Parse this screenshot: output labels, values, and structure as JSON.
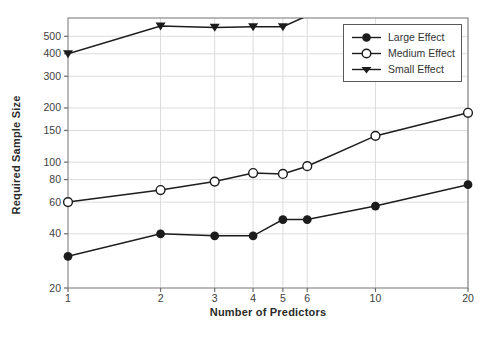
{
  "figure_title": "",
  "axes": {
    "x": {
      "title": "Number of Predictors"
    },
    "y": {
      "title": "Required Sample Size"
    }
  },
  "colors": {
    "line": "#1c1c1c",
    "grid": "#dcdcdc",
    "frame": "#8a8a8a",
    "tick": "#6e6e6e",
    "tick_text": "#3d3d3d",
    "background": "#ffffff",
    "marker_fill": "#1c1c1c",
    "marker_open_fill": "#ffffff"
  },
  "chart_data": {
    "type": "line",
    "title": "",
    "xlabel": "Number of Predictors",
    "ylabel": "Required Sample Size",
    "x_scale": "log",
    "y_scale": "log",
    "x": [
      1,
      2,
      3,
      4,
      5,
      6,
      10,
      20
    ],
    "x_ticks": [
      1,
      2,
      3,
      4,
      5,
      6,
      10,
      20
    ],
    "y_ticks": [
      20,
      40,
      60,
      80,
      100,
      150,
      200,
      300,
      400,
      500
    ],
    "xlim": [
      1,
      20
    ],
    "ylim": [
      20,
      632
    ],
    "grid": true,
    "legend_position": "top-right",
    "series": [
      {
        "name": "Large Effect",
        "marker": "filled-circle",
        "values": [
          30,
          40,
          39,
          39,
          48,
          48,
          57,
          75
        ]
      },
      {
        "name": "Medium Effect",
        "marker": "open-circle",
        "values": [
          60,
          70,
          78,
          87,
          86,
          95,
          140,
          188
        ]
      },
      {
        "name": "Small Effect",
        "marker": "filled-triangle-down",
        "values": [
          400,
          570,
          560,
          565,
          565,
          650,
          null,
          null
        ],
        "note": "line exits top of plot between x=5 and x=6; values beyond are off-scale"
      }
    ]
  }
}
